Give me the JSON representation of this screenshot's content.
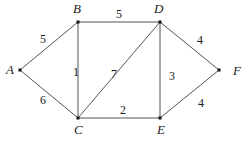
{
  "graph": {
    "nodes": [
      {
        "id": "A",
        "label": "A",
        "x": 20,
        "y": 70,
        "lx": 6,
        "ly": 74
      },
      {
        "id": "B",
        "label": "B",
        "x": 78,
        "y": 22,
        "lx": 73,
        "ly": 13
      },
      {
        "id": "D",
        "label": "D",
        "x": 160,
        "y": 22,
        "lx": 154,
        "ly": 13
      },
      {
        "id": "F",
        "label": "F",
        "x": 219,
        "y": 70,
        "lx": 233,
        "ly": 75
      },
      {
        "id": "C",
        "label": "C",
        "x": 78,
        "y": 118,
        "lx": 74,
        "ly": 134
      },
      {
        "id": "E",
        "label": "E",
        "x": 160,
        "y": 118,
        "lx": 157,
        "ly": 134
      }
    ],
    "edges": [
      {
        "from": "A",
        "to": "B",
        "weight": "5",
        "lx": 40,
        "ly": 43
      },
      {
        "from": "A",
        "to": "C",
        "weight": "6",
        "lx": 40,
        "ly": 104
      },
      {
        "from": "B",
        "to": "D",
        "weight": "5",
        "lx": 116,
        "ly": 18
      },
      {
        "from": "B",
        "to": "C",
        "weight": "1",
        "lx": 73,
        "ly": 76
      },
      {
        "from": "C",
        "to": "D",
        "weight": "7",
        "lx": 111,
        "ly": 78
      },
      {
        "from": "D",
        "to": "E",
        "weight": "3",
        "lx": 169,
        "ly": 80
      },
      {
        "from": "D",
        "to": "F",
        "weight": "4",
        "lx": 197,
        "ly": 44
      },
      {
        "from": "C",
        "to": "E",
        "weight": "2",
        "lx": 120,
        "ly": 114
      },
      {
        "from": "E",
        "to": "F",
        "weight": "4",
        "lx": 198,
        "ly": 107
      }
    ]
  }
}
